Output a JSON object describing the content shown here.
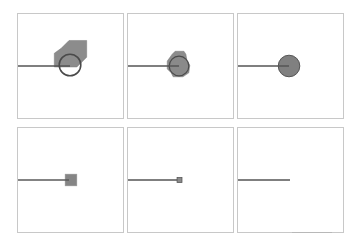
{
  "figure": {
    "layout": {
      "rows": 2,
      "cols": 3
    },
    "colors": {
      "panel_border": "#c8c8c8",
      "line": "#555555",
      "fill": "#8a8a8a",
      "circle_stroke": "#4a4a4a"
    },
    "panels": [
      {
        "id": "p1",
        "x": 17,
        "y": 13,
        "w": 107,
        "h": 106,
        "line_y": 53,
        "line_end_x": 53,
        "shape": "hexagon-with-circle",
        "shape_size": 34
      },
      {
        "id": "p2",
        "x": 127,
        "y": 13,
        "w": 107,
        "h": 106,
        "line_y": 53,
        "line_end_x": 52,
        "shape": "small-hexagon-with-circle",
        "shape_size": 25
      },
      {
        "id": "p3",
        "x": 237,
        "y": 13,
        "w": 107,
        "h": 106,
        "line_y": 53,
        "line_end_x": 52,
        "shape": "circle",
        "shape_size": 22
      },
      {
        "id": "p4",
        "x": 17,
        "y": 127,
        "w": 107,
        "h": 106,
        "line_y": 53,
        "line_end_x": 52,
        "shape": "square",
        "shape_size": 12
      },
      {
        "id": "p5",
        "x": 127,
        "y": 127,
        "w": 107,
        "h": 106,
        "line_y": 53,
        "line_end_x": 53,
        "shape": "tiny-square",
        "shape_size": 5
      },
      {
        "id": "p6",
        "x": 237,
        "y": 127,
        "w": 107,
        "h": 106,
        "line_y": 53,
        "line_end_x": 53,
        "shape": "none",
        "shape_size": 0
      }
    ]
  }
}
